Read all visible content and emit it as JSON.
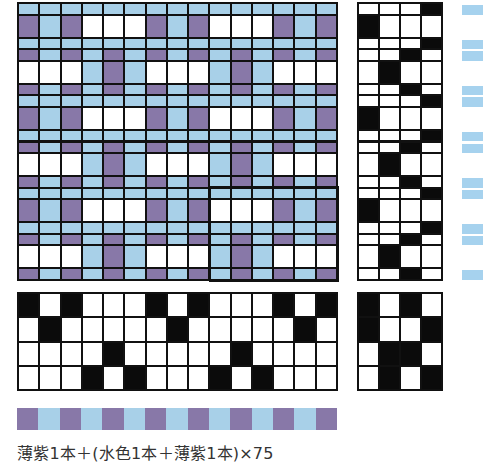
{
  "colors": {
    "purple": "#8878a8",
    "blue": "#a8d0e8",
    "white": "#ffffff",
    "black": "#0b0b0b",
    "line": "#141414",
    "strip_blue": "#a6d2ee"
  },
  "warp_colors": [
    "purple",
    "blue",
    "purple",
    "blue",
    "purple",
    "blue",
    "purple",
    "blue",
    "purple",
    "blue",
    "purple",
    "blue",
    "purple",
    "blue",
    "purple"
  ],
  "threading": [
    1,
    2,
    1,
    4,
    3,
    4,
    1,
    2,
    1,
    4,
    3,
    4,
    1,
    2,
    1
  ],
  "tieup": [
    [
      1,
      0,
      1,
      0
    ],
    [
      1,
      0,
      0,
      1
    ],
    [
      0,
      1,
      1,
      0
    ],
    [
      0,
      1,
      0,
      1
    ]
  ],
  "treadling": [
    {
      "treadle": 4,
      "size": "thin",
      "weft": "blue"
    },
    {
      "treadle": 1,
      "size": "thick",
      "weft": "white"
    },
    {
      "treadle": 4,
      "size": "thin",
      "weft": "blue"
    },
    {
      "treadle": 3,
      "size": "thin",
      "weft": "blue"
    },
    {
      "treadle": 2,
      "size": "thick",
      "weft": "white"
    },
    {
      "treadle": 3,
      "size": "thin",
      "weft": "blue"
    },
    {
      "treadle": 4,
      "size": "thin",
      "weft": "blue"
    },
    {
      "treadle": 1,
      "size": "thick",
      "weft": "white"
    },
    {
      "treadle": 4,
      "size": "thin",
      "weft": "blue"
    },
    {
      "treadle": 3,
      "size": "thin",
      "weft": "blue"
    },
    {
      "treadle": 2,
      "size": "thick",
      "weft": "white"
    },
    {
      "treadle": 3,
      "size": "thin",
      "weft": "blue"
    },
    {
      "treadle": 4,
      "size": "thin",
      "weft": "blue"
    },
    {
      "treadle": 1,
      "size": "thick",
      "weft": "white"
    },
    {
      "treadle": 4,
      "size": "thin",
      "weft": "blue"
    },
    {
      "treadle": 3,
      "size": "thin",
      "weft": "blue"
    },
    {
      "treadle": 2,
      "size": "thick",
      "weft": "white"
    },
    {
      "treadle": 3,
      "size": "thin",
      "weft": "blue"
    }
  ],
  "caption": "薄紫1本＋(水色1本＋薄紫1本)×75"
}
